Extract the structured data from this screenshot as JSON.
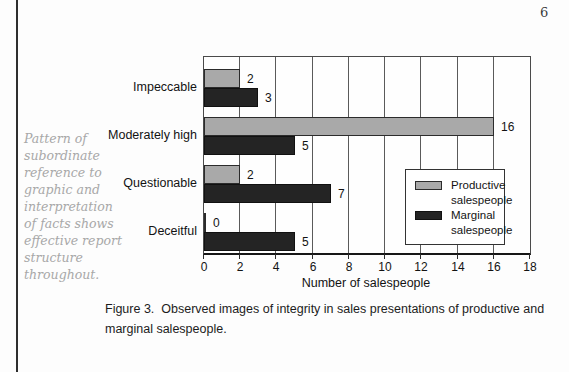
{
  "page": {
    "page_number": "6",
    "margin_note_lines": [
      "Pattern of",
      "subordinate",
      "reference to",
      "graphic and",
      "interpretation",
      "of facts shows",
      "effective report",
      "structure",
      "throughout."
    ],
    "caption_lines": [
      "Figure 3.  Observed images of integrity in sales presentations of productive and",
      "marginal salespeople."
    ]
  },
  "chart_data": {
    "type": "bar",
    "orientation": "horizontal",
    "categories": [
      "Impeccable",
      "Moderately high",
      "Questionable",
      "Deceitful"
    ],
    "series": [
      {
        "name": "Productive salespeople",
        "color": "#a9a9a9",
        "values": [
          2,
          16,
          2,
          0
        ]
      },
      {
        "name": "Marginal salespeople",
        "color": "#242424",
        "values": [
          3,
          5,
          7,
          5
        ]
      }
    ],
    "value_labels": [
      "2",
      "3",
      "16",
      "5",
      "2",
      "7",
      "0",
      "5"
    ],
    "xlabel": "Number of salespeople",
    "xlim": [
      0,
      18
    ],
    "xticks": [
      0,
      2,
      4,
      6,
      8,
      10,
      12,
      14,
      16,
      18
    ],
    "grid": true,
    "legend_position": "inside-right"
  }
}
